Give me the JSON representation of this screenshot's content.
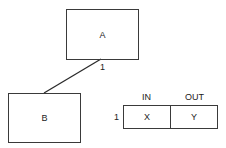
{
  "diagram": {
    "nodes": [
      {
        "id": "A",
        "label": "A"
      },
      {
        "id": "B",
        "label": "B"
      }
    ],
    "edge": {
      "from": "A",
      "to": "B",
      "multiplicity_label": "1"
    },
    "table": {
      "row_label": "1",
      "headers": [
        "IN",
        "OUT"
      ],
      "cells": [
        "X",
        "Y"
      ]
    },
    "colors": {
      "stroke": "#3a3a3a",
      "text": "#222222",
      "background": "#ffffff"
    }
  }
}
